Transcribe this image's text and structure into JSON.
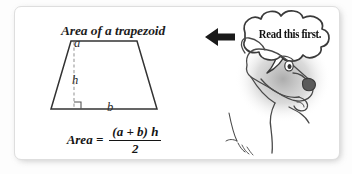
{
  "card": {
    "background_color": "#ffffff",
    "border_color": "#dedede"
  },
  "figure": {
    "title": "Area of a trapezoid",
    "shape": "trapezoid",
    "labels": {
      "top_side": "a",
      "bottom_side": "b",
      "height": "h"
    },
    "right_angle_marker": true,
    "height_line_style": "dashed"
  },
  "formula": {
    "lhs": "Area =",
    "numerator": "(a + b) h",
    "denominator": "2"
  },
  "callout": {
    "bubble_text": "Read this first.",
    "bubble_style": "cloud",
    "arrow_direction": "left",
    "arrow_color": "#1a1a1a"
  },
  "mascot": {
    "character": "cartoon-dog",
    "expression": "smiling",
    "style": "line-art",
    "shadow_color": "#c9c9c9"
  },
  "colors": {
    "ink": "#1d1d1d",
    "figure_stroke": "#333333",
    "dashed_stroke": "#9a9a9a",
    "page_background": "#fdfdfd"
  }
}
